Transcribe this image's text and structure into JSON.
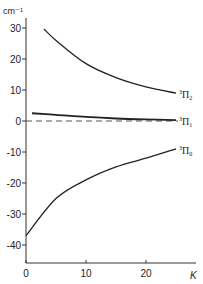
{
  "chart_data": {
    "type": "line",
    "title": "",
    "xlabel": "K",
    "ylabel": "cm⁻¹",
    "xlim": [
      0,
      27
    ],
    "ylim": [
      -46,
      33
    ],
    "grid": false,
    "x_ticks": [
      0,
      10,
      20
    ],
    "y_ticks": [
      30,
      20,
      10,
      0,
      -10,
      -20,
      -30,
      -40
    ],
    "x_tick_labels": [
      "0",
      "10",
      "20"
    ],
    "y_tick_labels": [
      "30",
      "20",
      "10",
      "0",
      "-10",
      "-20",
      "-30",
      "-40"
    ],
    "series": [
      {
        "name": "³Π₂",
        "label_base": "Π",
        "label_sup": "3",
        "label_sub": "2",
        "x": [
          3,
          5,
          10,
          15,
          20,
          25
        ],
        "y": [
          29.7,
          26,
          18.5,
          14,
          11,
          9
        ]
      },
      {
        "name": "³Π₁",
        "label_base": "Π",
        "label_sup": "3",
        "label_sub": "1",
        "x": [
          1,
          5,
          10,
          15,
          20,
          25
        ],
        "y": [
          2.5,
          2.0,
          1.3,
          0.8,
          0.5,
          0.3
        ]
      },
      {
        "name": "³Π₀",
        "label_base": "Π",
        "label_sup": "3",
        "label_sub": "0",
        "x": [
          0,
          5,
          10,
          15,
          20,
          25
        ],
        "y": [
          -37,
          -25,
          -19,
          -14.8,
          -12,
          -9
        ]
      }
    ],
    "reference_line": {
      "y": 0,
      "style": "dashed"
    }
  }
}
